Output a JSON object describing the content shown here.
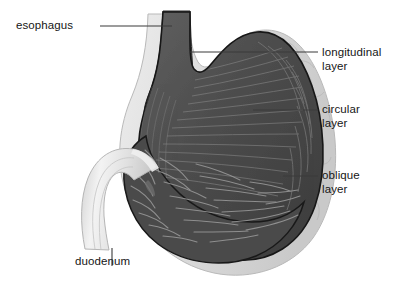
{
  "figure": {
    "background_color": "#ffffff",
    "width": 415,
    "height": 286,
    "palette": {
      "muscle_dark": "#4a4a4a",
      "muscle_mid": "#5a5a5a",
      "fiber_light": "#9a9a9a",
      "serosa_light": "#d9d9d9",
      "serosa_edge": "#bdbdbd",
      "duodenum_light": "#e4e4e4",
      "outline_dark": "#1d1d1d",
      "leader_line": "#3a3a3a",
      "text": "#161616"
    }
  },
  "labels": {
    "esophagus": "esophagus",
    "longitudinal_layer": "longitudinal\nlayer",
    "circular_layer": "circular\nlayer",
    "oblique_layer": "oblique\nlayer",
    "duodenum": "duodenum"
  },
  "structures": [
    {
      "id": "esophagus",
      "name": "esophagus",
      "description": "tubular inlet at top with longitudinal striations"
    },
    {
      "id": "fundus",
      "name": "fundus",
      "description": "upper dome of the stomach"
    },
    {
      "id": "body",
      "name": "body",
      "description": "main dark muscular body with rugae"
    },
    {
      "id": "antrum",
      "name": "antrum",
      "description": "lower narrowing portion"
    },
    {
      "id": "pylorus",
      "name": "pylorus",
      "description": "outlet toward duodenum"
    },
    {
      "id": "duodenum",
      "name": "duodenum",
      "description": "light tube exiting lower left"
    },
    {
      "id": "longitudinal-layer",
      "name": "longitudinal layer",
      "description": "outermost pale muscle coat"
    },
    {
      "id": "circular-layer",
      "name": "circular layer",
      "description": "middle muscle coat"
    },
    {
      "id": "oblique-layer",
      "name": "oblique layer",
      "description": "innermost muscle coat"
    }
  ],
  "leader_lines": [
    {
      "for": "esophagus",
      "x1": 100,
      "y1": 26,
      "x2": 172,
      "y2": 26
    },
    {
      "for": "longitudinal_layer",
      "x1": 318,
      "y1": 52,
      "x2": 190,
      "y2": 52
    },
    {
      "for": "circular_layer",
      "x1": 318,
      "y1": 110,
      "x2": 253,
      "y2": 110
    },
    {
      "for": "oblique_layer",
      "x1": 318,
      "y1": 176,
      "x2": 283,
      "y2": 176
    },
    {
      "for": "duodenum",
      "x1": 112,
      "y1": 248,
      "x2": 112,
      "y2": 265
    }
  ]
}
